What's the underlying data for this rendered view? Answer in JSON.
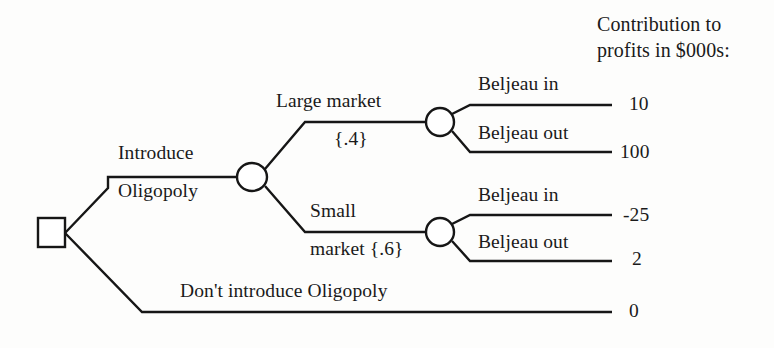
{
  "diagram": {
    "type": "decision-tree",
    "header": {
      "line1": "Contribution to",
      "line2": "profits in $000s:"
    },
    "nodes": {
      "decision_root": {
        "shape": "square",
        "name": "decision-node"
      },
      "chance_market": {
        "shape": "circle",
        "name": "market-chance-node"
      },
      "chance_large": {
        "shape": "circle",
        "name": "large-market-chance-node"
      },
      "chance_small": {
        "shape": "circle",
        "name": "small-market-chance-node"
      }
    },
    "branches": {
      "introduce_top": "Introduce",
      "introduce_bottom": "Oligopoly",
      "large_market": "Large market",
      "large_market_prob": "{.4}",
      "small_market_top": "Small",
      "small_market_bottom": "market {.6}",
      "dont_introduce": "Don't introduce Oligopoly",
      "beljeau_in_top": "Beljeau in",
      "beljeau_out_top": "Beljeau out",
      "beljeau_in_bottom": "Beljeau in",
      "beljeau_out_bottom": "Beljeau out"
    },
    "payoffs": {
      "large_in": "10",
      "large_out": "100",
      "small_in": "-25",
      "small_out": "2",
      "no_introduce": "0"
    },
    "colors": {
      "ink": "#161616",
      "paper": "#fdfdfc"
    }
  }
}
